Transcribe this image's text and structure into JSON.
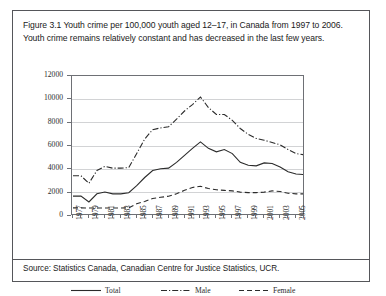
{
  "figure": {
    "caption": "Figure 3.1 Youth crime per 100,000 youth aged 12–17, in Canada from 1997 to 2006. Youth crime remains relatively constant and has decreased in the last few years.",
    "source": "Source: Statistics Canada, Canadian Centre for Justice Statistics, UCR."
  },
  "chart_data": {
    "type": "line",
    "title": "",
    "xlabel": "",
    "ylabel": "",
    "ylim": [
      0,
      12000
    ],
    "yticks": [
      0,
      2000,
      4000,
      6000,
      8000,
      10000,
      12000
    ],
    "ytick_labels": [
      "0",
      "2000",
      "4000",
      "6000",
      "8000",
      "10000",
      "12000"
    ],
    "grid": true,
    "legend_position": "below",
    "x": [
      1977,
      1978,
      1979,
      1980,
      1981,
      1982,
      1983,
      1984,
      1985,
      1986,
      1987,
      1988,
      1989,
      1990,
      1991,
      1992,
      1993,
      1994,
      1995,
      1996,
      1997,
      1998,
      1999,
      2000,
      2001,
      2002,
      2003,
      2004,
      2005,
      2006
    ],
    "xtick_labels": [
      "1977",
      "1979",
      "1981",
      "1983",
      "1985",
      "1987",
      "1989",
      "1991",
      "1993",
      "1995",
      "1997",
      "1999",
      "2001",
      "2003",
      "2005"
    ],
    "series": [
      {
        "name": "Total",
        "style": "solid",
        "color": "#2b2b2b",
        "values": [
          1700,
          1700,
          1200,
          1900,
          2050,
          1900,
          1900,
          2000,
          2600,
          3300,
          3900,
          4050,
          4100,
          4600,
          5200,
          5800,
          6350,
          5800,
          5500,
          5700,
          5350,
          4600,
          4350,
          4300,
          4550,
          4500,
          4200,
          3800,
          3600,
          3550
        ]
      },
      {
        "name": "Male",
        "style": "dash-dot",
        "color": "#2b2b2b",
        "values": [
          3450,
          3450,
          2800,
          3900,
          4250,
          4100,
          4100,
          4150,
          5350,
          6600,
          7400,
          7550,
          7650,
          8300,
          9000,
          9550,
          10200,
          9300,
          8700,
          8700,
          8200,
          7500,
          7000,
          6650,
          6500,
          6300,
          6100,
          5700,
          5350,
          5250
        ]
      },
      {
        "name": "Female",
        "style": "dashed",
        "color": "#2b2b2b",
        "values": [
          700,
          700,
          680,
          680,
          690,
          680,
          680,
          700,
          1050,
          1250,
          1500,
          1600,
          1700,
          1900,
          2200,
          2450,
          2550,
          2350,
          2250,
          2200,
          2150,
          2050,
          2000,
          2000,
          2050,
          2150,
          2100,
          1950,
          1900,
          1900
        ]
      }
    ],
    "legend": [
      {
        "label": "Total",
        "style": "solid"
      },
      {
        "label": "Male",
        "style": "dash-dot"
      },
      {
        "label": "Female",
        "style": "dashed"
      }
    ]
  }
}
